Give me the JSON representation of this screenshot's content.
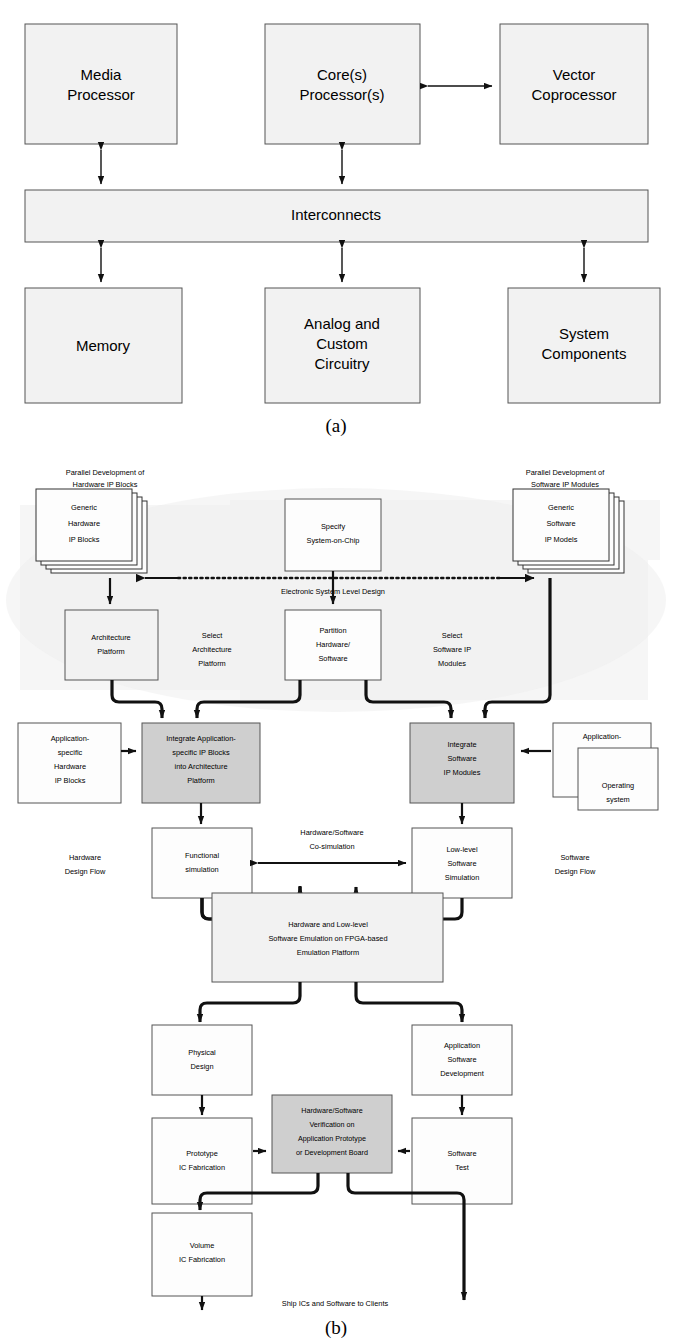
{
  "figure_a": {
    "caption": "(a)",
    "boxes": [
      {
        "id": "media-processor",
        "lines": [
          "Media",
          "Processor"
        ]
      },
      {
        "id": "core-processors",
        "lines": [
          "Core(s)",
          "Processor(s)"
        ]
      },
      {
        "id": "vector-coprocessor",
        "lines": [
          "Vector",
          "Coprocessor"
        ]
      },
      {
        "id": "interconnects",
        "lines": [
          "Interconnects"
        ]
      },
      {
        "id": "memory",
        "lines": [
          "Memory"
        ]
      },
      {
        "id": "analog-custom",
        "lines": [
          "Analog and",
          "Custom",
          "Circuitry"
        ]
      },
      {
        "id": "system-components",
        "lines": [
          "System",
          "Components"
        ]
      }
    ]
  },
  "figure_b": {
    "caption": "(b)",
    "labels": {
      "parallel_hw": [
        "Parallel Development of",
        "Hardware IP Blocks"
      ],
      "parallel_sw": [
        "Parallel Development of",
        "Software IP Modules"
      ],
      "esl": "Electronic System Level Design",
      "select_arch": [
        "Select",
        "Architecture",
        "Platform"
      ],
      "select_sw": [
        "Select",
        "Software IP",
        "Modules"
      ],
      "hw_flow": [
        "Hardware",
        "Design Flow"
      ],
      "sw_flow": [
        "Software",
        "Design Flow"
      ],
      "cosim": [
        "Hardware/Software",
        "Co-simulation"
      ],
      "ship": "Ship ICs and Software to Clients"
    },
    "boxes": [
      {
        "id": "generic-hardware-ip-blocks",
        "lines": [
          "Generic",
          "Hardware",
          "IP Blocks"
        ],
        "style": "stack"
      },
      {
        "id": "specify-system-on-chip",
        "lines": [
          "Specify",
          "System-on-Chip"
        ],
        "style": "white"
      },
      {
        "id": "generic-software-ip-models",
        "lines": [
          "Generic",
          "Software",
          "IP Models"
        ],
        "style": "stack"
      },
      {
        "id": "architecture-platform",
        "lines": [
          "Architecture",
          "Platform"
        ],
        "style": "light"
      },
      {
        "id": "partition-hardware-software",
        "lines": [
          "Partition",
          "Hardware/",
          "Software"
        ],
        "style": "white"
      },
      {
        "id": "application-specific-hardware-ip-blocks",
        "lines": [
          "Application-",
          "specific",
          "Hardware",
          "IP Blocks"
        ],
        "style": "white"
      },
      {
        "id": "integrate-application-specific-ip-blocks",
        "lines": [
          "Integrate Application-",
          "specific IP Blocks",
          "into Architecture",
          "Platform"
        ],
        "style": "gray"
      },
      {
        "id": "integrate-software-ip-modules",
        "lines": [
          "Integrate",
          "Software",
          "IP Modules"
        ],
        "style": "gray"
      },
      {
        "id": "application-specific-software-modules",
        "lines": [
          "Application-",
          "specific",
          "Software",
          "Modules"
        ],
        "style": "white"
      },
      {
        "id": "operating-system",
        "lines": [
          "Operating",
          "system"
        ],
        "style": "white"
      },
      {
        "id": "functional-simulation",
        "lines": [
          "Functional",
          "simulation"
        ],
        "style": "white"
      },
      {
        "id": "low-level-software-simulation",
        "lines": [
          "Low-level",
          "Software",
          "Simulation"
        ],
        "style": "white"
      },
      {
        "id": "emulation-platform",
        "lines": [
          "Hardware and Low-level",
          "Software Emulation on FPGA-based",
          "Emulation Platform"
        ],
        "style": "light"
      },
      {
        "id": "physical-design",
        "lines": [
          "Physical",
          "Design"
        ],
        "style": "white"
      },
      {
        "id": "application-software-development",
        "lines": [
          "Application",
          "Software",
          "Development"
        ],
        "style": "white"
      },
      {
        "id": "prototype-ic-fabrication",
        "lines": [
          "Prototype",
          "IC Fabrication"
        ],
        "style": "white"
      },
      {
        "id": "hardware-software-verification",
        "lines": [
          "Hardware/Software",
          "Verification on",
          "Application Prototype",
          "or Development Board"
        ],
        "style": "gray"
      },
      {
        "id": "software-test",
        "lines": [
          "Software",
          "Test"
        ],
        "style": "white"
      },
      {
        "id": "volume-ic-fabrication",
        "lines": [
          "Volume",
          "IC Fabrication"
        ],
        "style": "white"
      }
    ]
  },
  "colors": {
    "box_fill_light": "#f2f2f2",
    "box_fill_white": "#fdfdfd",
    "box_fill_gray": "#cfcfcf",
    "esl_background": "#eeeeee",
    "stroke": "#555555",
    "line": "#111111"
  }
}
